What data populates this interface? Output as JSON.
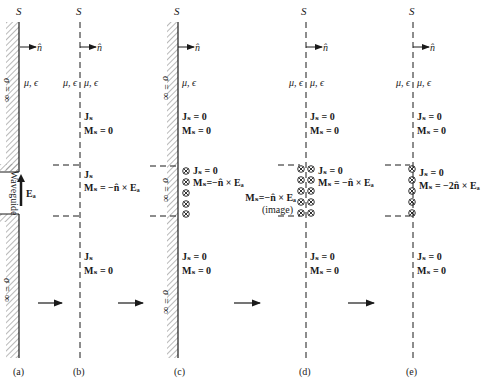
{
  "figure": {
    "surface_label": "S",
    "normal_label": "n̂",
    "medium_label": "μ, ϵ",
    "conductor_label": "σ = ∞",
    "waveguide_label": "Waveguide",
    "aperture_field_label": "Eₐ",
    "panels": [
      {
        "id": "a",
        "caption": "(a)",
        "type": "waveguide-aperture",
        "medium_right": "μ, ϵ",
        "conductor_top": "σ = ∞",
        "conductor_bottom": "σ = ∞"
      },
      {
        "id": "b",
        "caption": "(b)",
        "type": "equivalent-dashed",
        "medium_left": "μ, ϵ",
        "medium_right": "μ, ϵ",
        "top": {
          "J": "Jₛ",
          "M": "Mₛ = 0"
        },
        "aperture": {
          "J": "Jₛ",
          "M": "Mₛ = −n̂ × Eₐ"
        },
        "bottom": {
          "J": "Jₛ",
          "M": "Mₛ = 0"
        }
      },
      {
        "id": "c",
        "caption": "(c)",
        "type": "pec-backed",
        "medium_right": "μ, ϵ",
        "conductor_top": "σ = ∞",
        "conductor_bottom": "σ = ∞",
        "top": {
          "J": "Jₛ = 0",
          "M": "Mₛ = 0"
        },
        "aperture": {
          "J": "Jₛ = 0",
          "M": "Mₛ=−n̂ × Eₐ"
        },
        "bottom": {
          "J": "Jₛ = 0",
          "M": "Mₛ = 0"
        }
      },
      {
        "id": "d",
        "caption": "(d)",
        "type": "image-theory",
        "medium_left": "μ, ϵ",
        "medium_right": "μ, ϵ",
        "top": {
          "J": "Jₛ = 0",
          "M": "Mₛ = 0"
        },
        "aperture": {
          "J": "Jₛ = 0",
          "M": "Mₛ = −n̂ × Eₐ"
        },
        "image": {
          "M": "Mₛ=−n̂ × Eₐ",
          "note": "(image)"
        },
        "bottom": {
          "J": "Jₛ = 0",
          "M": "Mₛ = 0"
        }
      },
      {
        "id": "e",
        "caption": "(e)",
        "type": "final-equivalent",
        "medium_left": "μ, ϵ",
        "medium_right": "μ, ϵ",
        "top": {
          "J": "Jₛ = 0",
          "M": "Mₛ = 0"
        },
        "aperture": {
          "J": "Jₛ = 0",
          "M": "Mₛ = −2n̂ × Eₐ"
        },
        "bottom": {
          "J": "Jₛ = 0",
          "M": "Mₛ = 0"
        }
      }
    ],
    "transition_arrows": [
      "a→b",
      "b→c",
      "c→d",
      "d→e"
    ]
  }
}
